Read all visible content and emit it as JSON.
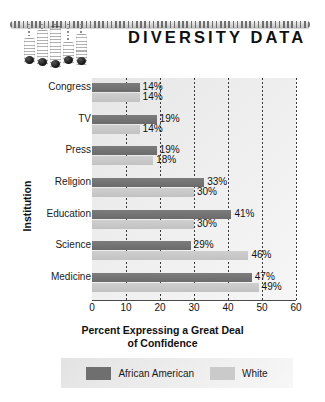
{
  "header": {
    "title": "DIVERSITY DATA",
    "graphic_name": "slider-bars-decoration",
    "sliders": [
      {
        "height": 26,
        "stem": 14
      },
      {
        "height": 36,
        "stem": 6
      },
      {
        "height": 42,
        "stem": 2
      },
      {
        "height": 22,
        "stem": 18
      },
      {
        "height": 31,
        "stem": 10
      }
    ]
  },
  "chart_data": {
    "type": "bar",
    "orientation": "horizontal",
    "title": "DIVERSITY DATA",
    "xlabel": "Percent Expressing a Great Deal of Confidence",
    "xlabel_line1": "Percent Expressing a Great Deal",
    "xlabel_line2": "of Confidence",
    "ylabel": "Institution",
    "categories": [
      "Congress",
      "TV",
      "Press",
      "Religion",
      "Education",
      "Science",
      "Medicine"
    ],
    "series": [
      {
        "name": "African American",
        "color": "#6f6f6f",
        "values": [
          14,
          19,
          19,
          33,
          41,
          29,
          47
        ]
      },
      {
        "name": "White",
        "color": "#cacaca",
        "values": [
          14,
          14,
          18,
          30,
          30,
          46,
          49
        ]
      }
    ],
    "value_suffix": "%",
    "value_labels": {
      "African American": [
        "14%",
        "19%",
        "19%",
        "33%",
        "41%",
        "29%",
        "47%"
      ],
      "White": [
        "14%",
        "14%",
        "18%",
        "30%",
        "30%",
        "46%",
        "49%"
      ]
    },
    "xlim": [
      0,
      60
    ],
    "xticks": [
      0,
      10,
      20,
      30,
      40,
      50,
      60
    ],
    "xtick_labels": [
      "0",
      "10",
      "20",
      "30",
      "40",
      "50",
      "60"
    ],
    "grid": true,
    "grid_style": "dotted-vertical",
    "legend_position": "bottom"
  },
  "legend": {
    "entries": [
      {
        "label": "African American",
        "color": "#6f6f6f"
      },
      {
        "label": "White",
        "color": "#cacaca"
      }
    ]
  }
}
